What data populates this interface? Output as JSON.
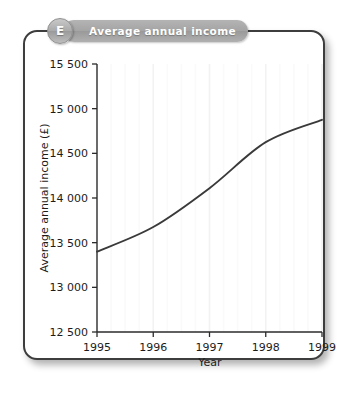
{
  "panel": {
    "badge_letter": "E",
    "badge_title": "Average annual income"
  },
  "chart_data": {
    "type": "line",
    "title": "Average annual income",
    "xlabel": "Year",
    "ylabel": "Average annual income (£)",
    "x": [
      1995,
      1996,
      1997,
      1998,
      1999
    ],
    "categories": [
      "1995",
      "1996",
      "1997",
      "1998",
      "1999"
    ],
    "values": [
      13400,
      13675,
      14110,
      14625,
      14875
    ],
    "series": [
      {
        "name": "Average annual income",
        "values": [
          13400,
          13675,
          14110,
          14625,
          14875
        ]
      }
    ],
    "xlim": [
      1995,
      1999
    ],
    "ylim": [
      12500,
      15500
    ],
    "ytick_labels": [
      "12 500",
      "13 000",
      "13 500",
      "14 000",
      "14 500",
      "15 000",
      "15 500"
    ],
    "ytick_values": [
      12500,
      13000,
      13500,
      14000,
      14500,
      15000,
      15500
    ],
    "xtick_labels": [
      "1995",
      "1996",
      "1997",
      "1998",
      "1999"
    ],
    "grid": "vertical-faint",
    "legend": "none",
    "line_color": "#3a3a3a",
    "smoothing": "curved"
  }
}
